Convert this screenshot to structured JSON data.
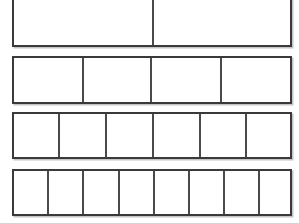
{
  "figure": {
    "kind": "fraction-bar-model",
    "background_color": "#ffffff",
    "border_color": "#3a3a3a",
    "divider_color": "#4a4a4a",
    "fill_color": "#ffffff",
    "shadow_color": "#969696",
    "canvas": {
      "width": 299,
      "height": 223
    }
  },
  "chart_data": {
    "type": "bar",
    "xlabel": "",
    "ylabel": "",
    "categories": [
      "bar-1",
      "bar-2",
      "bar-3",
      "bar-4"
    ],
    "values": [
      2,
      4,
      6,
      8
    ],
    "series": [
      {
        "name": "number of parts",
        "values": [
          2,
          4,
          6,
          8
        ]
      }
    ],
    "grid": false,
    "legend": "none",
    "annotations": []
  },
  "bars": [
    {
      "name": "bar-halves",
      "parts": 2,
      "label": "",
      "x": 12,
      "y": -3,
      "width": 280,
      "height": 50,
      "clipped_top": true,
      "cell_widths": [
        140,
        136
      ]
    },
    {
      "name": "bar-fourths",
      "parts": 4,
      "label": "",
      "x": 12,
      "y": 56,
      "width": 280,
      "height": 48,
      "clipped_top": false,
      "cell_widths": [
        70,
        68,
        70,
        68
      ]
    },
    {
      "name": "bar-sixths",
      "parts": 6,
      "label": "",
      "x": 12,
      "y": 112,
      "width": 280,
      "height": 47,
      "clipped_top": false,
      "cell_widths": [
        46,
        47,
        47,
        47,
        46,
        43
      ]
    },
    {
      "name": "bar-eighths",
      "parts": 8,
      "label": "",
      "x": 12,
      "y": 169,
      "width": 280,
      "height": 47,
      "clipped_top": false,
      "cell_widths": [
        35,
        35,
        36,
        35,
        35,
        35,
        35,
        30
      ]
    }
  ]
}
